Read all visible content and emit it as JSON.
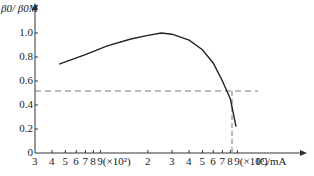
{
  "chart_data": {
    "type": "line",
    "title": "",
    "xlabel": "I_C/mA",
    "ylabel": "β0/β0M",
    "x_scale": "log",
    "x_ticks": [
      "3",
      "4",
      "5",
      "6",
      "7",
      "8",
      "9(×10²)",
      "2",
      "3",
      "4",
      "5",
      "6",
      "7",
      "8",
      "9(×10³)"
    ],
    "y_ticks": [
      "0",
      "0.2",
      "0.4",
      "0.6",
      "0.8",
      "1.0"
    ],
    "ylim": [
      0,
      1.1
    ],
    "xlim_mA": [
      300,
      10000
    ],
    "series": [
      {
        "name": "β0/β0M vs I_C",
        "x": [
          450,
          700,
          1000,
          1500,
          2000,
          2500,
          3000,
          4000,
          5000,
          6000,
          7000,
          8000,
          8800
        ],
        "y": [
          0.74,
          0.82,
          0.89,
          0.95,
          0.98,
          1.0,
          0.99,
          0.94,
          0.86,
          0.75,
          0.6,
          0.45,
          0.22
        ]
      }
    ],
    "annotations": [
      {
        "type": "hline_dashed",
        "y": 0.5
      },
      {
        "type": "vline_dashed",
        "x": 7800,
        "note": "intersection at β0/β0M = 0.5"
      }
    ],
    "grid": false,
    "legend": null
  },
  "labels": {
    "y_axis": "β0/ β0M",
    "x_axis": "IC/mA",
    "x_mult_1": "(×10²)",
    "x_mult_2": "(×10³)"
  }
}
